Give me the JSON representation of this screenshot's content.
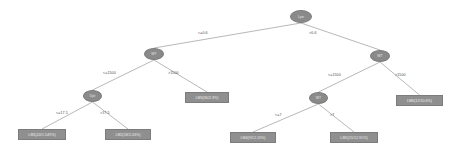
{
  "diagram": {
    "type": "decision-tree",
    "background_color": "#ffffff",
    "node_fill_color": "#8a8a8a",
    "leaf_fill_color": "#8f8f8f",
    "edge_color": "#9a9a9a",
    "label_color": "#4a4a4a"
  },
  "nodes": [
    {
      "id": "n0",
      "label": "Lpe",
      "x": 290,
      "y": 10,
      "w": 22,
      "h": 13
    },
    {
      "id": "n1",
      "label": "WT",
      "x": 144,
      "y": 48,
      "w": 20,
      "h": 12
    },
    {
      "id": "n2",
      "label": "WT",
      "x": 370,
      "y": 50,
      "w": 20,
      "h": 12
    },
    {
      "id": "n3",
      "label": "Dpt",
      "x": 83,
      "y": 90,
      "w": 19,
      "h": 12
    },
    {
      "id": "n4",
      "label": "WT",
      "x": 309,
      "y": 92,
      "w": 19,
      "h": 12
    }
  ],
  "leaves": [
    {
      "id": "l1",
      "label": "LM1(20/1.549%)",
      "x": 18,
      "y": 129,
      "w": 48,
      "h": 11
    },
    {
      "id": "l2",
      "label": "LM2(18/2.03%)",
      "x": 105,
      "y": 129,
      "w": 46,
      "h": 11
    },
    {
      "id": "l3",
      "label": "LM3(36/2.3%)",
      "x": 185,
      "y": 92,
      "w": 44,
      "h": 11
    },
    {
      "id": "l4",
      "label": "LM4(9/12.15%)",
      "x": 230,
      "y": 132,
      "w": 46,
      "h": 11
    },
    {
      "id": "l5",
      "label": "LM5(15/12.91%)",
      "x": 330,
      "y": 132,
      "w": 48,
      "h": 11
    },
    {
      "id": "l6",
      "label": "LM6(12/10.6%)",
      "x": 396,
      "y": 95,
      "w": 47,
      "h": 11
    }
  ],
  "edges": [
    {
      "from": "n0",
      "to": "n1",
      "label": "<=0.6",
      "lx": 198,
      "ly": 31
    },
    {
      "from": "n0",
      "to": "n2",
      "label": ">0.6",
      "lx": 309,
      "ly": 31
    },
    {
      "from": "n1",
      "to": "n3",
      "label": "<=1500",
      "lx": 103,
      "ly": 71
    },
    {
      "from": "n1",
      "to": "l3",
      "label": ">1500",
      "lx": 168,
      "ly": 71
    },
    {
      "from": "n2",
      "to": "n4",
      "label": "<=1500",
      "lx": 328,
      "ly": 73
    },
    {
      "from": "n2",
      "to": "l6",
      "label": ">1500",
      "lx": 395,
      "ly": 73
    },
    {
      "from": "n3",
      "to": "l1",
      "label": "<=17.5",
      "lx": 56,
      "ly": 111
    },
    {
      "from": "n3",
      "to": "l2",
      "label": ">17.5",
      "lx": 100,
      "ly": 111
    },
    {
      "from": "n4",
      "to": "l4",
      "label": "<=7",
      "lx": 275,
      "ly": 113
    },
    {
      "from": "n4",
      "to": "l5",
      "label": ">7",
      "lx": 330,
      "ly": 113
    }
  ]
}
